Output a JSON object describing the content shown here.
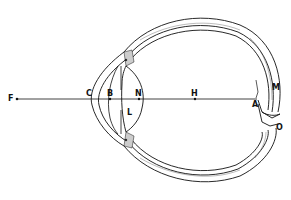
{
  "diagram": {
    "type": "anatomical cross-section of the eye",
    "labels": {
      "F": "F",
      "C": "C",
      "B": "B",
      "N": "N",
      "H": "H",
      "A": "A",
      "M": "M",
      "O": "O",
      "L": "L"
    },
    "points_on_axis": [
      "F",
      "C",
      "B",
      "N",
      "H",
      "A"
    ],
    "colors": {
      "line": "#111111",
      "background": "#ffffff",
      "hatch": "#555555"
    }
  }
}
